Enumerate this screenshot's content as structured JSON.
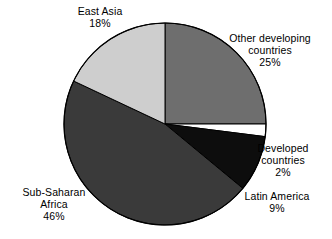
{
  "chart_data": {
    "type": "pie",
    "title": "",
    "subtitle": "",
    "xlabel": "",
    "ylabel": "",
    "legend_position": "none",
    "grid": false,
    "labels_outside": true,
    "start_angle_deg": 0,
    "direction": "clockwise",
    "categories": [
      "Other developing countries",
      "Developed countries",
      "Latin America",
      "Sub-Saharan Africa",
      "East Asia"
    ],
    "values": [
      25,
      2,
      9,
      46,
      18
    ],
    "value_suffix": "%",
    "slices": [
      {
        "name": "Other developing countries",
        "label_line1": "Other developing",
        "label_line2": "countries",
        "value": 25,
        "value_text": "25%",
        "color": "#6e6e6e",
        "start_deg": 0,
        "end_deg": 90
      },
      {
        "name": "Developed countries",
        "label_line1": "Developed",
        "label_line2": "countries",
        "value": 2,
        "value_text": "2%",
        "color": "#ffffff",
        "start_deg": 90,
        "end_deg": 97.2
      },
      {
        "name": "Latin America",
        "label_line1": "Latin America",
        "label_line2": "",
        "value": 9,
        "value_text": "9%",
        "color": "#0d0d0d",
        "start_deg": 97.2,
        "end_deg": 129.6
      },
      {
        "name": "Sub-Saharan Africa",
        "label_line1": "Sub-Saharan",
        "label_line2": "Africa",
        "value": 46,
        "value_text": "46%",
        "color": "#3a3a3a",
        "start_deg": 129.6,
        "end_deg": 295.2
      },
      {
        "name": "East Asia",
        "label_line1": "East Asia",
        "label_line2": "",
        "value": 18,
        "value_text": "18%",
        "color": "#cecece",
        "start_deg": 295.2,
        "end_deg": 360
      }
    ],
    "geometry": {
      "center_x": 165,
      "center_y": 124,
      "radius": 101
    },
    "colors": {
      "background": "#ffffff",
      "outline": "#000000",
      "text": "#000000"
    }
  }
}
